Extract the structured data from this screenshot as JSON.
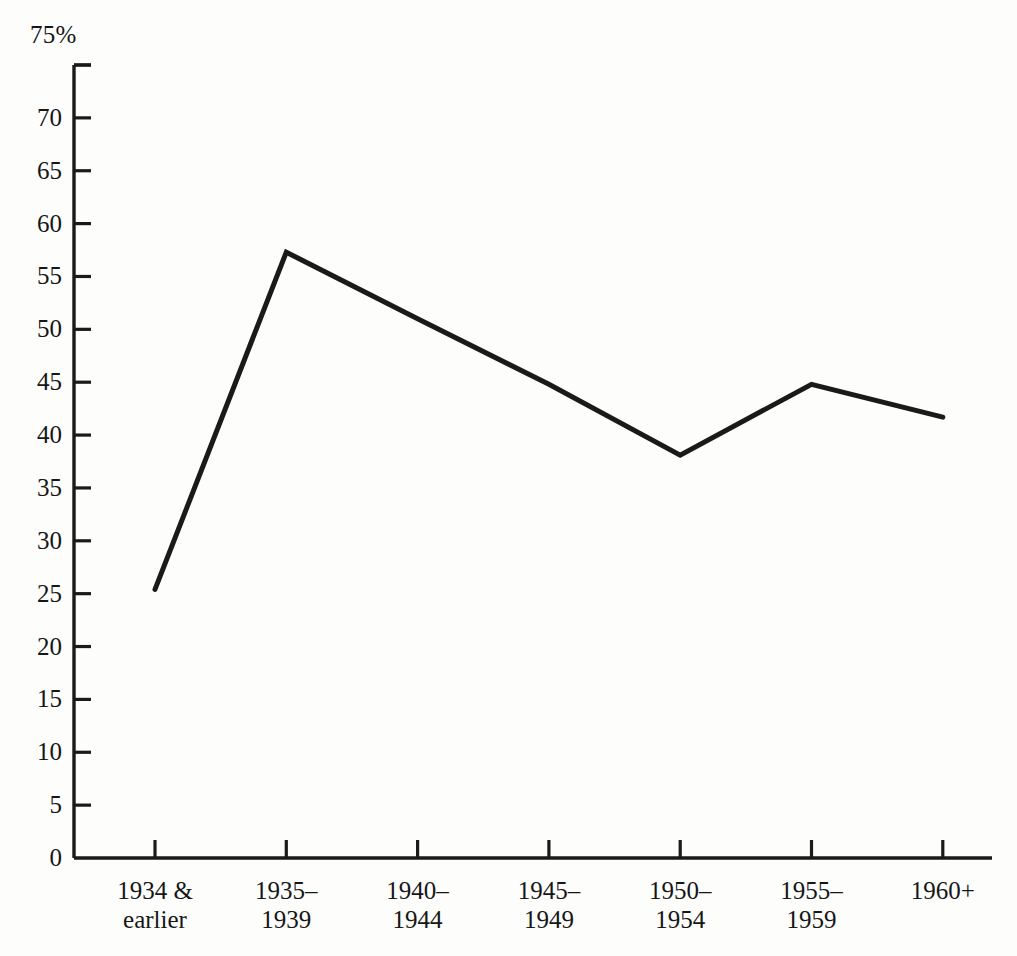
{
  "chart_data": {
    "type": "line",
    "title": "",
    "subtitle": "",
    "xlabel": "",
    "ylabel": "",
    "y_unit_label": "75%",
    "categories": [
      "1934 & earlier",
      "1935–1939",
      "1940–1944",
      "1945–1949",
      "1950–1954",
      "1955–1959",
      "1960+"
    ],
    "category_lines": [
      [
        "1934 &",
        "earlier"
      ],
      [
        "1935–",
        "1939"
      ],
      [
        "1940–",
        "1944"
      ],
      [
        "1945–",
        "1949"
      ],
      [
        "1950–",
        "1954"
      ],
      [
        "1955–",
        "1959"
      ],
      [
        "1960+"
      ]
    ],
    "values": [
      25.4,
      57.3,
      51.0,
      44.8,
      38.1,
      44.8,
      41.7
    ],
    "ylim": [
      0,
      75
    ],
    "xlim": [
      0,
      6
    ],
    "yticks": [
      0,
      5,
      10,
      15,
      20,
      25,
      30,
      35,
      40,
      45,
      50,
      55,
      60,
      65,
      70,
      75
    ],
    "ytick_labels": [
      "0",
      "5",
      "10",
      "15",
      "20",
      "25",
      "30",
      "35",
      "40",
      "45",
      "50",
      "55",
      "60",
      "65",
      "70",
      "75%"
    ],
    "grid": false,
    "legend": null,
    "legend_position": "none",
    "series": [
      {
        "name": "percentage",
        "values": [
          25.4,
          57.3,
          51.0,
          44.8,
          38.1,
          44.8,
          41.7
        ]
      }
    ],
    "line_color": "#1a1a1a",
    "line_width": 5,
    "markers": false,
    "annotations": []
  },
  "colors": {
    "ink": "#1a1a1a",
    "paper": "#fdfdfc",
    "axis": "#1a1a1a"
  },
  "geometry": {
    "axis_left_x": 74,
    "axis_bottom_y": 858,
    "axis_top_y": 65,
    "axis_right_x": 992,
    "first_tick_x": 155,
    "tick_spacing": 131.3,
    "y_unit_per_px": 10.573
  }
}
